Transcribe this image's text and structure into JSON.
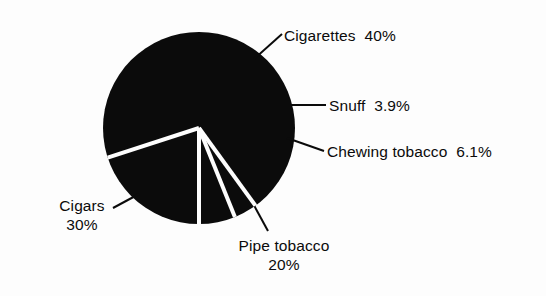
{
  "figure": {
    "name": "tobacco-product-share-pie-chart",
    "background_color": "#fdfdfd",
    "ink_color": "#0b0b0b",
    "separator_color": "#fdfdfd"
  },
  "labels": {
    "cigarettes": "Cigarettes  40%",
    "snuff": "Snuff  3.9%",
    "chewing": "Chewing tobacco  6.1%",
    "cigars_name": "Cigars",
    "cigars_value": "30%",
    "pipe_name": "Pipe tobacco",
    "pipe_value": "20%"
  },
  "chart_data": {
    "type": "pie",
    "title": "",
    "subtitle": "",
    "xlabel": "",
    "ylabel": "",
    "legend_position": "none",
    "grid": false,
    "labels_outside": true,
    "leader_lines": true,
    "start_angle_deg": 0,
    "direction": "clockwise",
    "units": "percent",
    "total": 100,
    "categories": [
      "Cigarettes",
      "Snuff",
      "Chewing tobacco",
      "Pipe tobacco",
      "Cigars"
    ],
    "values": [
      40,
      3.9,
      6.1,
      20,
      30
    ],
    "value_labels": [
      "40%",
      "3.9%",
      "6.1%",
      "20%",
      "30%"
    ],
    "slice_color": "#0b0b0b",
    "slices": [
      {
        "name": "Cigarettes",
        "value": 40,
        "value_label": "40%",
        "label_text": "Cigarettes  40%",
        "start_angle_deg": 0,
        "end_angle_deg": 144,
        "label_position": "right-top"
      },
      {
        "name": "Snuff",
        "value": 3.9,
        "value_label": "3.9%",
        "label_text": "Snuff  3.9%",
        "start_angle_deg": 144,
        "end_angle_deg": 158.04,
        "label_position": "right-middle"
      },
      {
        "name": "Chewing tobacco",
        "value": 6.1,
        "value_label": "6.1%",
        "label_text": "Chewing tobacco  6.1%",
        "start_angle_deg": 158.04,
        "end_angle_deg": 180,
        "label_position": "right-lower"
      },
      {
        "name": "Pipe tobacco",
        "value": 20,
        "value_label": "20%",
        "label_text": "Pipe tobacco 20%",
        "start_angle_deg": 180,
        "end_angle_deg": 252,
        "label_position": "bottom"
      },
      {
        "name": "Cigars",
        "value": 30,
        "value_label": "30%",
        "label_text": "Cigars 30%",
        "start_angle_deg": 252,
        "end_angle_deg": 360,
        "label_position": "left"
      }
    ]
  }
}
